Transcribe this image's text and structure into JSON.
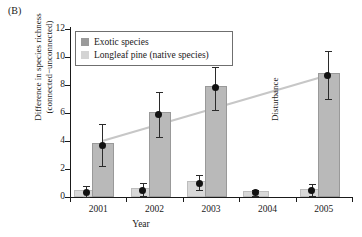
{
  "panel": {
    "label": "(B)"
  },
  "legend": {
    "items": [
      {
        "label": "Exotic species",
        "swatch": "#9a9a9a",
        "key": "exotic"
      },
      {
        "label": "Longleaf pine (native species)",
        "swatch": "#d4d4d4",
        "key": "native"
      }
    ]
  },
  "annotations": [
    {
      "name": "disturbance-annotation",
      "text": "Disturbance",
      "x_year": "2004"
    }
  ],
  "chart_data": {
    "type": "bar",
    "title": "",
    "xlabel": "Year",
    "ylabel": "Difference in species richness (connected−unconnected)",
    "ylabel_line1": "Difference in species richness",
    "ylabel_line2": "(connected−unconnected)",
    "categories": [
      "2001",
      "2002",
      "2003",
      "2004",
      "2005"
    ],
    "ylim": [
      0,
      12
    ],
    "yticks": [
      0,
      2,
      4,
      6,
      8,
      10,
      12
    ],
    "grid": false,
    "legend_position": "top-left-inside",
    "series": [
      {
        "name": "Exotic species",
        "key": "exotic",
        "color": "#b9b9b9",
        "values": [
          3.7,
          5.9,
          7.8,
          null,
          8.7
        ],
        "err_low": [
          2.2,
          4.3,
          6.2,
          null,
          7.0
        ],
        "err_high": [
          5.2,
          7.5,
          9.3,
          null,
          10.4
        ]
      },
      {
        "name": "Longleaf pine (native species)",
        "key": "native",
        "color": "#d8d8d8",
        "values": [
          0.35,
          0.5,
          1.0,
          0.3,
          0.45
        ],
        "err_low": [
          0.0,
          0.1,
          0.5,
          0.1,
          0.05
        ],
        "err_high": [
          0.8,
          1.0,
          1.6,
          0.5,
          0.9
        ]
      }
    ],
    "trendline": {
      "name": "exotic-trend",
      "x": [
        "2001",
        "2005"
      ],
      "y": [
        4.0,
        8.7
      ]
    }
  }
}
